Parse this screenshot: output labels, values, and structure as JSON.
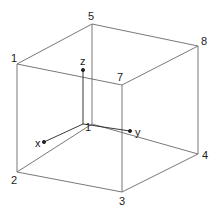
{
  "diagram": {
    "type": "cube-with-axes",
    "colors": {
      "edge": "#6a6a6a",
      "axis": "#222222",
      "label": "#222222",
      "background": "#ffffff"
    },
    "vertices": [
      {
        "label": "1",
        "x": 17,
        "y": 64,
        "lx": 11,
        "ly": 62
      },
      {
        "label": "2",
        "x": 17,
        "y": 172,
        "lx": 11,
        "ly": 184
      },
      {
        "label": "3",
        "x": 122,
        "y": 192,
        "lx": 119,
        "ly": 205
      },
      {
        "label": "4",
        "x": 198,
        "y": 154,
        "lx": 202,
        "ly": 159
      },
      {
        "label": "5",
        "x": 92,
        "y": 24,
        "lx": 88,
        "ly": 20
      },
      {
        "label": "7",
        "x": 122,
        "y": 85,
        "lx": 117,
        "ly": 81
      },
      {
        "label": "8",
        "x": 198,
        "y": 46,
        "lx": 201,
        "ly": 45
      }
    ],
    "hidden_vertex": {
      "x": 92,
      "y": 124
    },
    "axes": {
      "origin": {
        "x": 83,
        "y": 124,
        "label": "1"
      },
      "x": {
        "label": "x",
        "tip": {
          "x": 44,
          "y": 142
        }
      },
      "y": {
        "label": "y",
        "tip": {
          "x": 130,
          "y": 131
        }
      },
      "z": {
        "label": "z",
        "tip": {
          "x": 83,
          "y": 70
        }
      }
    }
  }
}
